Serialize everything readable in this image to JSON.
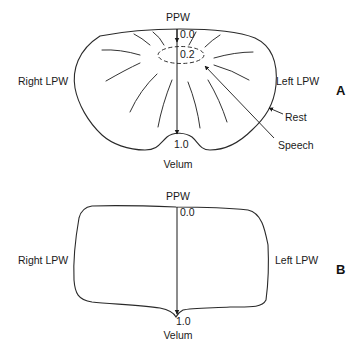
{
  "panel_a": {
    "letter": "A",
    "labels": {
      "top": "PPW",
      "left": "Right LPW",
      "right": "Left LPW",
      "bottom": "Velum",
      "scale_start": "0.0",
      "scale_mid": "0.2",
      "scale_end": "1.0",
      "rest_pointer": "Rest",
      "speech_pointer": "Speech"
    }
  },
  "panel_b": {
    "letter": "B",
    "labels": {
      "top": "PPW",
      "left": "Right LPW",
      "right": "Left LPW",
      "bottom": "Velum",
      "scale_start": "0.0",
      "scale_end": "1.0"
    }
  },
  "colors": {
    "line": "#2a2a2a",
    "text": "#1a1a1a",
    "background": "#ffffff"
  }
}
